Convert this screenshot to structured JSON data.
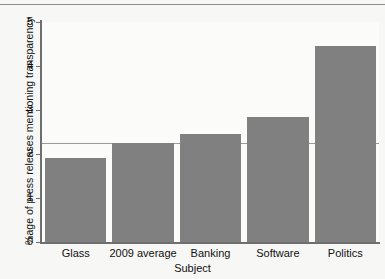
{
  "chart_data": {
    "type": "bar",
    "title": "",
    "xlabel": "Subject",
    "ylabel": "%age of press releases mentioning transparency",
    "categories": [
      "Glass",
      "2009 average",
      "Banking",
      "Software",
      "Politics"
    ],
    "values": [
      1.9,
      2.25,
      2.45,
      2.85,
      4.45
    ],
    "ylim": [
      0,
      5
    ],
    "yticks": [
      0,
      1,
      2,
      3,
      4,
      5
    ],
    "ytick_labels": [
      "0",
      "1",
      "2",
      "3",
      "4",
      "5"
    ],
    "grid": false,
    "legend": null,
    "annotations": [
      {
        "type": "horizontal-reference-line",
        "value": 2.25,
        "color": "#9a9a9a"
      }
    ],
    "bar_color": "#808080",
    "axis_color": "#6f6f6f",
    "background": "#f7f7f5"
  }
}
